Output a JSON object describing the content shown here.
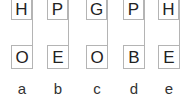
{
  "diagram": {
    "columns": [
      {
        "label": "a",
        "top": "H",
        "bottom": "O"
      },
      {
        "label": "b",
        "top": "P",
        "bottom": "E"
      },
      {
        "label": "c",
        "top": "G",
        "bottom": "O"
      },
      {
        "label": "d",
        "top": "P",
        "bottom": "B"
      },
      {
        "label": "e",
        "top": "H",
        "bottom": "E"
      }
    ],
    "colors": {
      "line": "#b4b4b4",
      "text": "#222222"
    }
  }
}
